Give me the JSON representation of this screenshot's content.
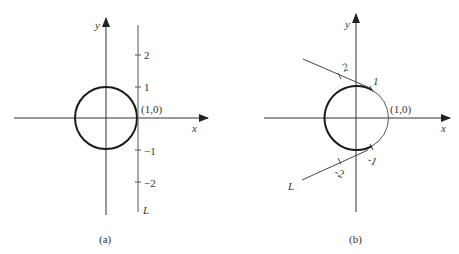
{
  "panel_a": {
    "caption": "(a)",
    "x_axis_label": "x",
    "y_axis_label": "y",
    "point_label": "(1,0)",
    "line_label": "L",
    "ticks": [
      "2",
      "1",
      "−1",
      "−2"
    ]
  },
  "panel_b": {
    "caption": "(b)",
    "x_axis_label": "x",
    "y_axis_label": "y",
    "point_label": "(1,0)",
    "line_label": "L",
    "ticks": [
      "2",
      "1",
      "-1",
      "-2"
    ]
  }
}
